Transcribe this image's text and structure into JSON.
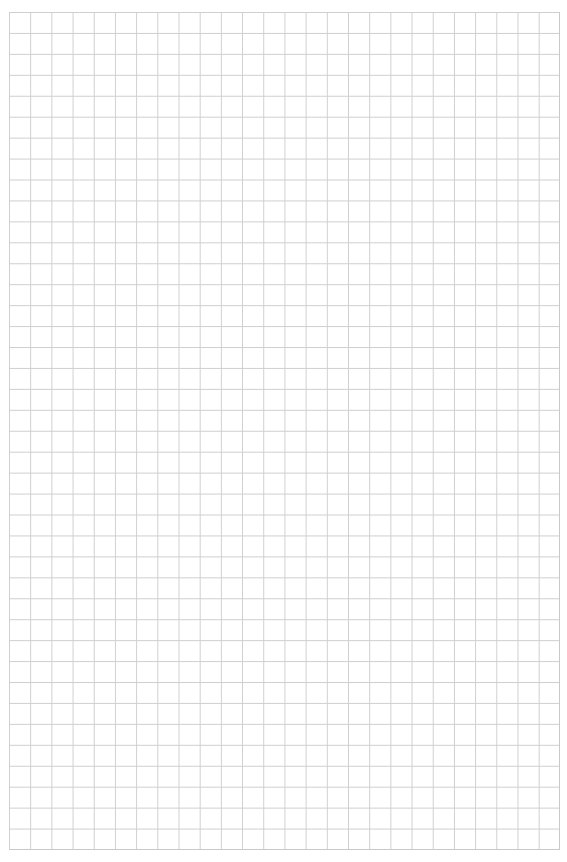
{
  "page": {
    "type": "graph-paper",
    "background_color": "#ffffff",
    "line_color": "#cfcfcf",
    "columns": 26,
    "rows": 40
  }
}
